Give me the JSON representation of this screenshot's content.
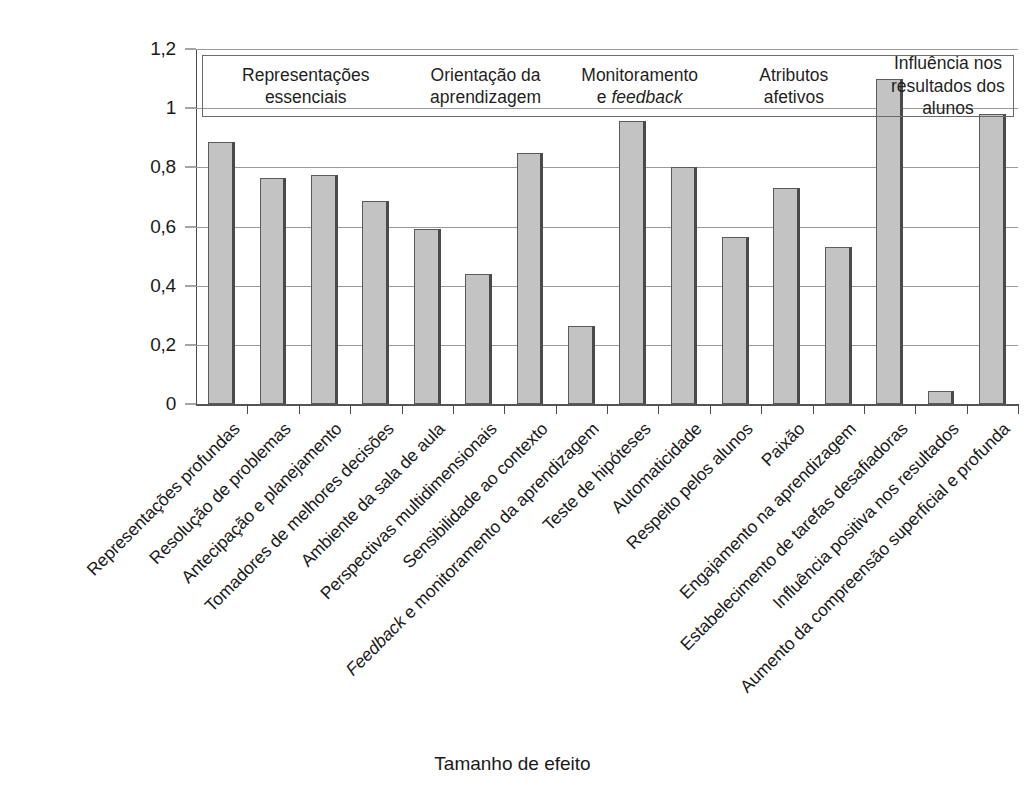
{
  "chart_data": {
    "type": "bar",
    "title": "",
    "xlabel": "Tamanho de efeito",
    "ylabel": "",
    "ylim": [
      0,
      1.2
    ],
    "yticks": [
      0,
      0.2,
      0.4,
      0.6,
      0.8,
      1,
      1.2
    ],
    "ytick_labels": [
      "0",
      "0,2",
      "0,4",
      "0,6",
      "0,8",
      "1",
      "1,2"
    ],
    "grid": true,
    "legend": "none",
    "bar_color": "#c3c3c3",
    "bar_edge_color": "#5a5a5a",
    "categories": [
      "Representações profundas",
      "Resolução de problemas",
      "Antecipação e planejamento",
      "Tomadores de melhores decisões",
      "Ambiente da sala de aula",
      "Perspectivas multidimensionais",
      "Sensibilidade ao contexto",
      "Feedback e monitoramento da aprendizagem",
      "Teste de hipóteses",
      "Automaticidade",
      "Respeito pelos alunos",
      "Paixão",
      "Engajamento na aprendizagem",
      "Estabelecimento de tarefas desafiadoras",
      "Influência positiva nos resultados",
      "Aumento da compreensão superficial e profunda"
    ],
    "values": [
      0.885,
      0.765,
      0.775,
      0.685,
      0.59,
      0.44,
      0.85,
      0.265,
      0.955,
      0.8,
      0.565,
      0.73,
      0.53,
      1.1,
      0.045,
      0.98
    ],
    "groups": [
      {
        "label_line1": "Representações",
        "label_line2": "essenciais",
        "label_italic": "",
        "span": 4
      },
      {
        "label_line1": "Orientação da",
        "label_line2": "aprendizagem",
        "label_italic": "",
        "span": 3
      },
      {
        "label_line1": "Monitoramento",
        "label_line2": "e ",
        "label_italic": "feedback",
        "span": 3
      },
      {
        "label_line1": "Atributos",
        "label_line2": "afetivos",
        "label_italic": "",
        "span": 3
      },
      {
        "label_line1": "Influência nos",
        "label_line2": "resultados dos alunos",
        "label_italic": "",
        "span": 3
      }
    ],
    "italic_labels": [
      "Feedback e monitoramento da aprendizagem"
    ]
  },
  "figure": {
    "axis_title": "Tamanho de efeito"
  }
}
